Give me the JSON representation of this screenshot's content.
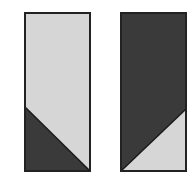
{
  "figure": {
    "colors": {
      "light": "#d6d6d6",
      "dark": "#3a3a3a",
      "border": "#222222",
      "background": "#ffffff"
    },
    "panels": [
      {
        "name": "left-rectangle",
        "x": 25,
        "y": 13,
        "width": 65,
        "height": 158,
        "fill": "light",
        "triangle": {
          "fill": "dark",
          "points": "25,107 25,171 90,171"
        }
      },
      {
        "name": "right-rectangle",
        "x": 121,
        "y": 13,
        "width": 65,
        "height": 158,
        "fill": "dark",
        "triangle": {
          "fill": "light",
          "points": "121,171 186,171 186,109"
        }
      }
    ]
  }
}
